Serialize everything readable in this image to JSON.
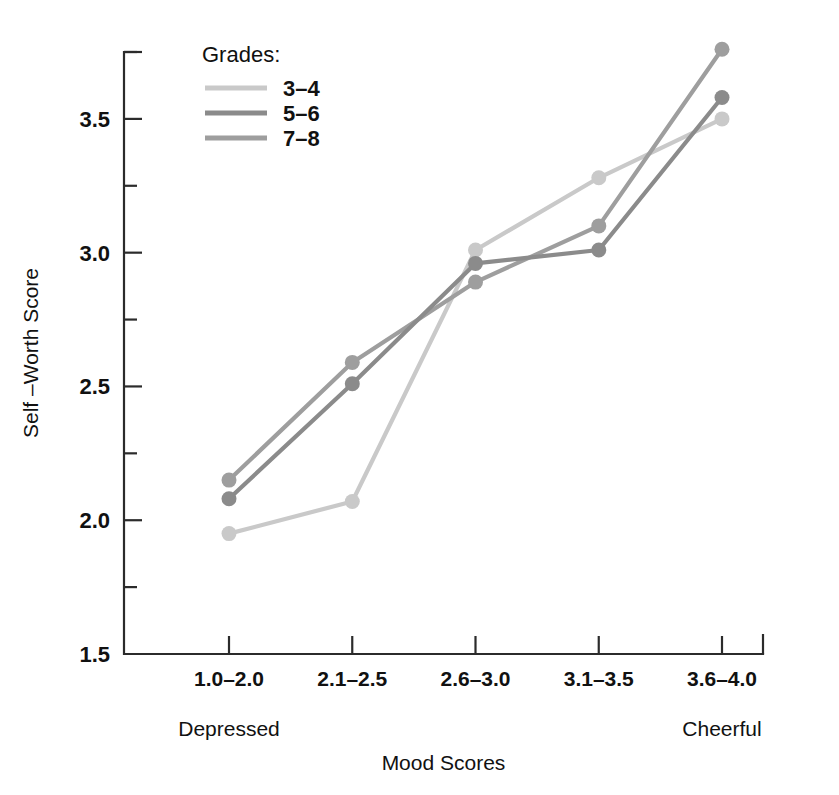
{
  "chart_data": {
    "type": "line",
    "title": "",
    "xlabel": "Mood Scores",
    "ylabel": "Self –Worth Score",
    "categories": [
      "1.0–2.0",
      "2.1–2.5",
      "2.6–3.0",
      "3.1–3.5",
      "3.6–4.0"
    ],
    "x_endpoint_labels": {
      "left": "Depressed",
      "right": "Cheerful"
    },
    "ylim": [
      1.5,
      3.75
    ],
    "ytick_values": [
      1.5,
      2.0,
      2.5,
      3.0,
      3.5
    ],
    "ytick_labels": [
      "1.5",
      "2.0",
      "2.5",
      "3.0",
      "3.5"
    ],
    "yminor_tick_values": [
      1.75,
      2.25,
      2.75,
      3.25,
      3.75
    ],
    "grid": false,
    "legend_position": "upper-left-inside",
    "legend_title": "Grades:",
    "markers": true,
    "series": [
      {
        "name": "3–4",
        "color": "#c9c9c9",
        "values": [
          1.95,
          2.07,
          3.01,
          3.28,
          3.5
        ]
      },
      {
        "name": "5–6",
        "color": "#8b8b8b",
        "values": [
          2.08,
          2.51,
          2.96,
          3.01,
          3.58
        ]
      },
      {
        "name": "7–8",
        "color": "#9e9e9e",
        "values": [
          2.15,
          2.59,
          2.89,
          3.1,
          3.76
        ]
      }
    ]
  },
  "legend": {
    "title": "Grades:",
    "items": [
      {
        "label": "3–4",
        "color": "#c9c9c9"
      },
      {
        "label": "5–6",
        "color": "#8b8b8b"
      },
      {
        "label": "7–8",
        "color": "#9e9e9e"
      }
    ]
  },
  "axes": {
    "y_title": "Self –Worth Score",
    "x_title": "Mood Scores",
    "y_labels": [
      "3.5",
      "3.0",
      "2.5",
      "2.0",
      "1.5"
    ],
    "x_labels": [
      "1.0–2.0",
      "2.1–2.5",
      "2.6–3.0",
      "3.1–3.5",
      "3.6–4.0"
    ],
    "left_anchor": "Depressed",
    "right_anchor": "Cheerful"
  }
}
